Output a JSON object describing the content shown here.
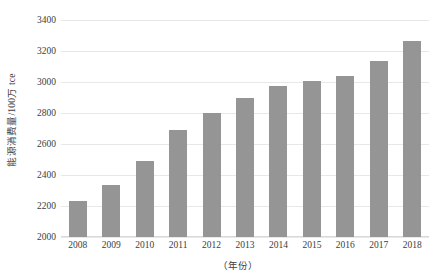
{
  "chart_data": {
    "type": "bar",
    "title": "",
    "subtitle": "",
    "xlabel": "（年份）",
    "ylabel": "能源消费量/100万 tce",
    "categories": [
      "2008",
      "2009",
      "2010",
      "2011",
      "2012",
      "2013",
      "2014",
      "2015",
      "2016",
      "2017",
      "2018"
    ],
    "values": [
      2235,
      2335,
      2490,
      2690,
      2800,
      2900,
      2975,
      3005,
      3040,
      3135,
      3265
    ],
    "series": [
      {
        "name": "能源消费量",
        "values": [
          2235,
          2335,
          2490,
          2690,
          2800,
          2900,
          2975,
          3005,
          3040,
          3135,
          3265
        ]
      }
    ],
    "ylim": [
      2000,
      3400
    ],
    "xlim": [
      0,
      11
    ],
    "ytick_labels": [
      "2000",
      "2200",
      "2400",
      "2600",
      "2800",
      "3000",
      "3200",
      "3400"
    ],
    "ytick_values": [
      2000,
      2200,
      2400,
      2600,
      2800,
      3000,
      3200,
      3400
    ],
    "ytick_step": 200,
    "grid": true,
    "grid_axis": "y",
    "legend": false,
    "legend_position": "none",
    "bar_color": "#959595",
    "grid_color": "#e8e8e8",
    "axis_color": "#d9d9d9",
    "text_color": "#3d3d3d",
    "background_color": "#ffffff",
    "annotations": []
  }
}
